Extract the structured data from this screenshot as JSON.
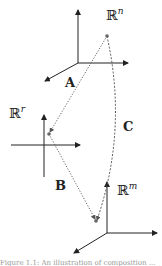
{
  "diagram": {
    "spaces": [
      {
        "id": "Rn",
        "symbol": "ℝ",
        "exponent": "n",
        "origin": [
          78,
          63
        ],
        "point": [
          107,
          36
        ]
      },
      {
        "id": "Rr",
        "symbol": "ℝ",
        "exponent": "r",
        "origin": [
          44,
          145
        ],
        "point": [
          49,
          134
        ]
      },
      {
        "id": "Rm",
        "symbol": "ℝ",
        "exponent": "m",
        "origin": [
          107,
          233
        ],
        "point": [
          96,
          221
        ]
      }
    ],
    "maps": [
      {
        "label": "A",
        "from": "Rn",
        "to": "Rr",
        "style": "dotted"
      },
      {
        "label": "B",
        "from": "Rr",
        "to": "Rm",
        "style": "dotted"
      },
      {
        "label": "C",
        "from": "Rn",
        "to": "Rm",
        "style": "dashed-curve"
      }
    ],
    "caption": "Figure 1.1: An illustration of composition ..."
  },
  "colors": {
    "axis": "#222222",
    "dotted": "#555555",
    "point": "#666666"
  }
}
